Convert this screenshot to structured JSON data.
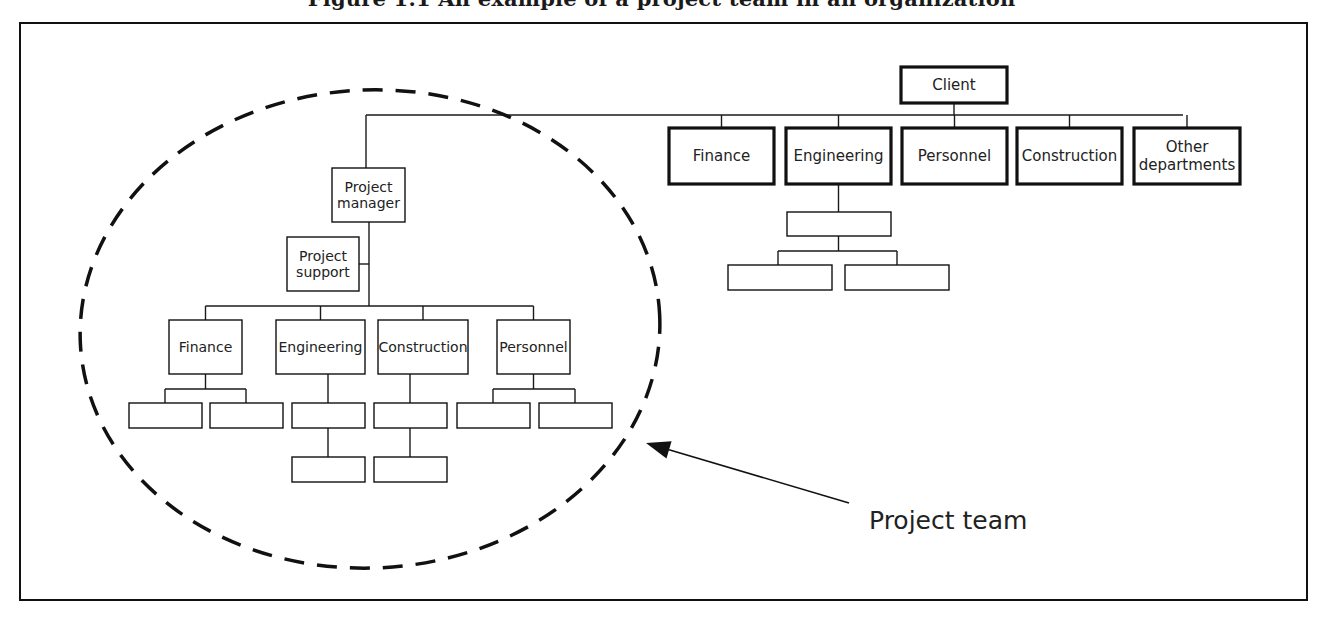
{
  "title": "Figure 1.1  An example of a project team in an organization",
  "colors": {
    "line": "#1a1a1a",
    "background": "#ffffff"
  },
  "client_org": {
    "top": {
      "id": "client",
      "label": "Client",
      "x": 901,
      "y": 67,
      "w": 106,
      "h": 36
    },
    "bus_y": 115,
    "departments": [
      {
        "id": "dept-finance",
        "label": "Finance",
        "x": 669,
        "y": 128,
        "w": 105,
        "h": 56
      },
      {
        "id": "dept-engineering",
        "label": "Engineering",
        "x": 786,
        "y": 128,
        "w": 105,
        "h": 56
      },
      {
        "id": "dept-personnel",
        "label": "Personnel",
        "x": 902,
        "y": 128,
        "w": 105,
        "h": 56
      },
      {
        "id": "dept-construction",
        "label": "Construction",
        "x": 1017,
        "y": 128,
        "w": 105,
        "h": 56
      },
      {
        "id": "dept-other",
        "label": "Other departments",
        "lines": [
          "Other",
          "departments"
        ],
        "x": 1134,
        "y": 128,
        "w": 106,
        "h": 56
      }
    ],
    "engineering_sub": [
      {
        "id": "eng-sub-1",
        "label": "",
        "x": 787,
        "y": 212,
        "w": 104,
        "h": 24
      },
      {
        "id": "eng-sub-2",
        "label": "",
        "x": 728,
        "y": 265,
        "w": 104,
        "h": 25
      },
      {
        "id": "eng-sub-3",
        "label": "",
        "x": 845,
        "y": 265,
        "w": 104,
        "h": 25
      }
    ]
  },
  "project_team": {
    "label": "Project team",
    "manager": {
      "id": "project-manager",
      "label": "Project manager",
      "lines": [
        "Project",
        "manager"
      ],
      "x": 332,
      "y": 168,
      "w": 73,
      "h": 54
    },
    "support": {
      "id": "project-support",
      "label": "Project support",
      "lines": [
        "Project",
        "support"
      ],
      "x": 287,
      "y": 237,
      "w": 72,
      "h": 54
    },
    "bus_y": 306,
    "functions": [
      {
        "id": "team-finance",
        "label": "Finance",
        "x": 169,
        "y": 320,
        "w": 73,
        "h": 54
      },
      {
        "id": "team-engineering",
        "label": "Engineering",
        "x": 276,
        "y": 320,
        "w": 89,
        "h": 54
      },
      {
        "id": "team-construction",
        "label": "Construction",
        "x": 378,
        "y": 320,
        "w": 90,
        "h": 54
      },
      {
        "id": "team-personnel",
        "label": "Personnel",
        "x": 497,
        "y": 320,
        "w": 73,
        "h": 54
      }
    ],
    "sub_boxes": [
      {
        "x": 129,
        "y": 403,
        "w": 73,
        "h": 25
      },
      {
        "x": 210,
        "y": 403,
        "w": 73,
        "h": 25
      },
      {
        "x": 292,
        "y": 403,
        "w": 73,
        "h": 25
      },
      {
        "x": 292,
        "y": 457,
        "w": 73,
        "h": 25
      },
      {
        "x": 374,
        "y": 403,
        "w": 73,
        "h": 25
      },
      {
        "x": 374,
        "y": 457,
        "w": 73,
        "h": 25
      },
      {
        "x": 457,
        "y": 403,
        "w": 73,
        "h": 25
      },
      {
        "x": 539,
        "y": 403,
        "w": 73,
        "h": 25
      }
    ],
    "ellipse": {
      "cx": 370,
      "cy": 329,
      "rx": 290,
      "ry": 239
    },
    "arrow": {
      "x1": 849,
      "y1": 503,
      "x2": 646,
      "y2": 443
    },
    "label_pos": {
      "x": 869,
      "y": 529
    }
  }
}
